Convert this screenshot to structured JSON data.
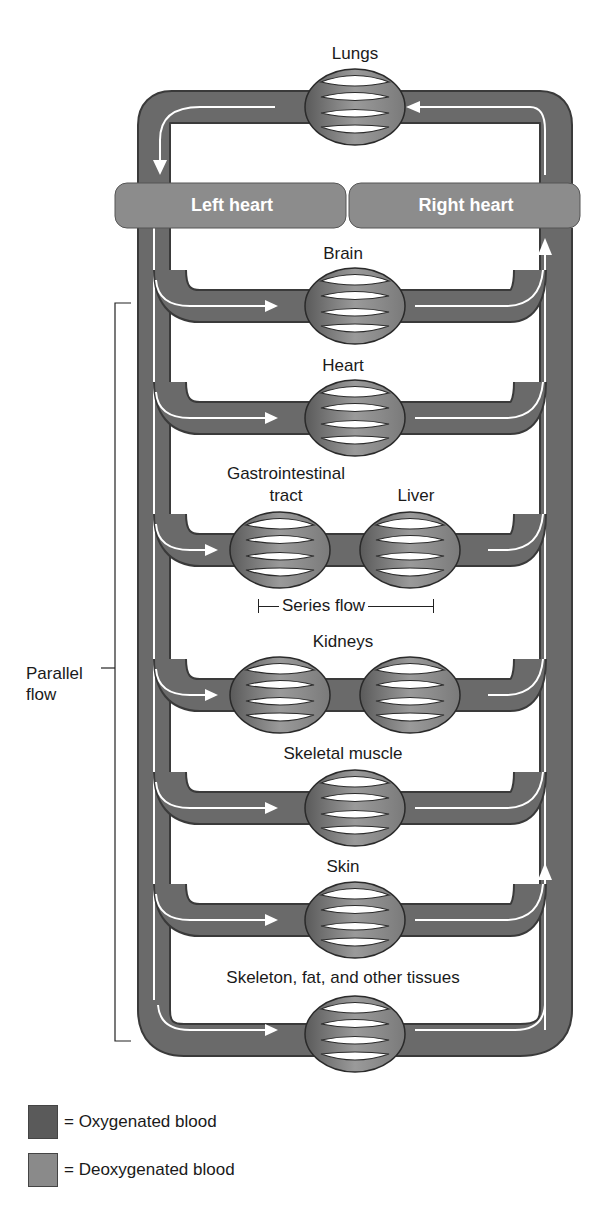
{
  "diagram": {
    "pulmonary": {
      "label": "Lungs"
    },
    "hearts": {
      "left": "Left heart",
      "right": "Right heart"
    },
    "organs": [
      {
        "label": "Brain",
        "type": "parallel"
      },
      {
        "label": "Heart",
        "type": "parallel"
      },
      {
        "label": "Gastrointestinal tract",
        "type": "series-first"
      },
      {
        "label": "Liver",
        "type": "series-second"
      },
      {
        "label": "Kidneys",
        "type": "parallel-double"
      },
      {
        "label": "Skeletal muscle",
        "type": "parallel"
      },
      {
        "label": "Skin",
        "type": "parallel"
      },
      {
        "label": "Skeleton, fat, and other tissues",
        "type": "parallel"
      }
    ],
    "labels": {
      "gi_line1": "Gastrointestinal",
      "gi_line2": "tract",
      "series_flow": "Series flow",
      "parallel_line1": "Parallel",
      "parallel_line2": "flow"
    },
    "legend": [
      {
        "label": "= Oxygenated blood",
        "color": "#5a5a5a"
      },
      {
        "label": "= Deoxygenated blood",
        "color": "#8a8a8a"
      }
    ],
    "colors": {
      "oxygenated": "#5a5a5a",
      "deoxygenated": "#8a8a8a",
      "heart_box": "#8c8c8c",
      "flow_arrow": "#ffffff"
    }
  }
}
